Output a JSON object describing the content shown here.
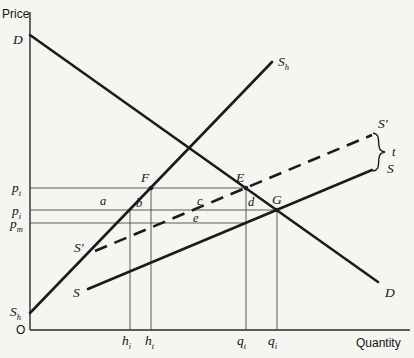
{
  "figure": {
    "price_axis": "Price",
    "quantity_axis": "Quantity",
    "origin": "O"
  },
  "labels": {
    "demand_top": "D",
    "demand_bottom": "D",
    "home_supply": {
      "base": "S",
      "sub": "h"
    },
    "supply_left": "S",
    "supply_right": "S",
    "supply_shifted_left": "S′",
    "supply_shifted_right": "S′",
    "tax": "t",
    "point_f": "F",
    "point_e": "E",
    "point_g": "G"
  },
  "prices": {
    "pt": {
      "base": "p",
      "sub": "t"
    },
    "pi": {
      "base": "p",
      "sub": "i"
    },
    "pm": {
      "base": "p",
      "sub": "m"
    }
  },
  "quantities": {
    "hi": {
      "base": "h",
      "sub": "i"
    },
    "ht": {
      "base": "h",
      "sub": "t"
    },
    "qt": {
      "base": "q",
      "sub": "t"
    },
    "qi": {
      "base": "q",
      "sub": "i"
    }
  },
  "areas": {
    "a": "a",
    "b": "b",
    "c": "c",
    "d": "d",
    "e": "e"
  }
}
